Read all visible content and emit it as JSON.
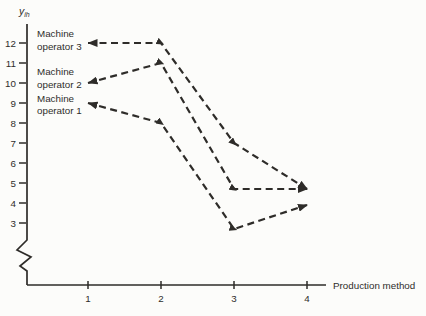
{
  "chart_data": {
    "type": "line",
    "title": "",
    "ylabel": {
      "main": "y",
      "sub": "ih"
    },
    "xlabel": "Production method",
    "x": [
      1,
      2,
      3,
      4
    ],
    "x_tick_labels": [
      "1",
      "2",
      "3",
      "4"
    ],
    "y_tick_labels": [
      "12",
      "11",
      "10",
      "9",
      "8",
      "7",
      "6",
      "5",
      "4",
      "3"
    ],
    "y_tick_values": [
      12,
      11,
      10,
      9,
      8,
      7,
      6,
      5,
      4,
      3
    ],
    "ylim_shown": [
      3,
      12
    ],
    "axis_break": true,
    "grid": false,
    "line_style": "dashed",
    "stroke_color": "#2e2c29",
    "background_color": "#fcfcfa",
    "legend_position": "inline-left-of-lines",
    "series": [
      {
        "name": "Machine operator 3",
        "label_lines": [
          "Machine",
          "operator 3"
        ],
        "values": [
          12,
          12,
          7,
          4.7
        ]
      },
      {
        "name": "Machine operator 2",
        "label_lines": [
          "Machine",
          "operator 2"
        ],
        "values": [
          10,
          11,
          4.7,
          4.7
        ]
      },
      {
        "name": "Machine operator 1",
        "label_lines": [
          "Machine",
          "operator 1"
        ],
        "values": [
          9,
          8,
          2.7,
          3.9
        ]
      }
    ]
  }
}
